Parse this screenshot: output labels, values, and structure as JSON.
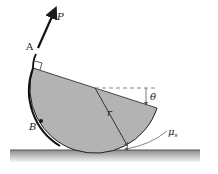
{
  "diagram": {
    "labels": {
      "force": "P",
      "point_a": "A",
      "point_b": "B",
      "radius": "r",
      "angle": "θ",
      "friction": "μ",
      "friction_sub": "s"
    },
    "colors": {
      "disk_fill": "#b3b3b3",
      "outline": "#1a1a1a",
      "ground_top": "#9a9a9a",
      "ground_bottom": "#f2f2f2",
      "dashed": "#8a8a8a"
    }
  }
}
